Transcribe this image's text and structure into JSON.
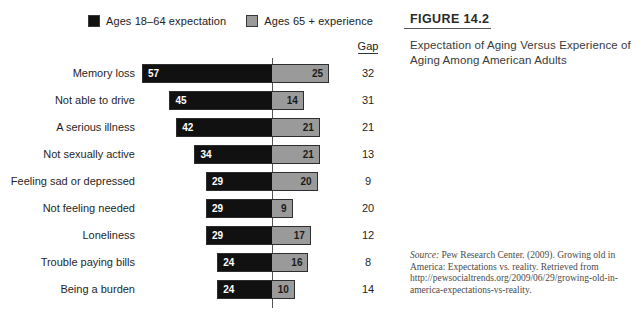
{
  "figure": {
    "number": "FIGURE 14.2",
    "title": "Expectation of Aging Versus Experience of Aging Among American Adults",
    "source_label": "Source:",
    "source_text": " Pew Research Center. (2009). Growing old in America: Expectations vs. reality. Retrieved from http://pewsocialtrends.org/2009/06/29/growing-old-in-america-expectations-vs-reality."
  },
  "legend": {
    "items": [
      {
        "label": "Ages 18–64 expectation",
        "color": "#111111",
        "swatch": "black"
      },
      {
        "label": "Ages 65 + experience",
        "color": "#9a9a9a",
        "swatch": "gray"
      }
    ]
  },
  "gap_column": {
    "header": "Gap"
  },
  "chart_data": {
    "type": "bar",
    "orientation": "horizontal",
    "subtype": "diverging-bidirectional",
    "title": "Expectation of Aging Versus Experience of Aging Among American Adults",
    "xlabel": "",
    "ylabel": "",
    "grid": false,
    "legend_position": "top",
    "axis_zero": 0,
    "units": "percent",
    "categories": [
      "Memory loss",
      "Not able to drive",
      "A serious illness",
      "Not sexually active",
      "Feeling sad or depressed",
      "Not feeling needed",
      "Loneliness",
      "Trouble paying bills",
      "Being a burden"
    ],
    "series": [
      {
        "name": "Ages 18–64 expectation",
        "color": "#111111",
        "direction": "left",
        "values": [
          57,
          45,
          42,
          34,
          29,
          29,
          29,
          24,
          24
        ]
      },
      {
        "name": "Ages 65 + experience",
        "color": "#9a9a9a",
        "direction": "right",
        "values": [
          25,
          14,
          21,
          21,
          20,
          9,
          17,
          16,
          10
        ]
      }
    ],
    "gap": {
      "name": "Gap",
      "values": [
        32,
        31,
        21,
        13,
        9,
        20,
        12,
        8,
        14
      ]
    },
    "xlim": [
      -60,
      30
    ]
  },
  "rows": [
    {
      "label": "Memory loss",
      "expectation": 57,
      "experience": 25,
      "gap": 32
    },
    {
      "label": "Not able to drive",
      "expectation": 45,
      "experience": 14,
      "gap": 31
    },
    {
      "label": "A serious illness",
      "expectation": 42,
      "experience": 21,
      "gap": 21
    },
    {
      "label": "Not sexually active",
      "expectation": 34,
      "experience": 21,
      "gap": 13
    },
    {
      "label": "Feeling sad or depressed",
      "expectation": 29,
      "experience": 20,
      "gap": 9
    },
    {
      "label": "Not feeling needed",
      "expectation": 29,
      "experience": 9,
      "gap": 20
    },
    {
      "label": "Loneliness",
      "expectation": 29,
      "experience": 17,
      "gap": 12
    },
    {
      "label": "Trouble paying bills",
      "expectation": 24,
      "experience": 16,
      "gap": 8
    },
    {
      "label": "Being a burden",
      "expectation": 24,
      "experience": 10,
      "gap": 14
    }
  ],
  "layout": {
    "zero_x": 272,
    "px_per_unit": 2.28,
    "row_height": 27,
    "rows_top": 60
  },
  "colors": {
    "expectation": "#111111",
    "experience": "#9a9a9a",
    "axis": "#555555",
    "text": "#1f1f1f"
  }
}
